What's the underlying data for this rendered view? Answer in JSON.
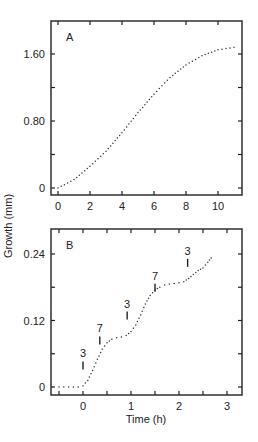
{
  "chart_data": [
    {
      "panel": "A",
      "type": "scatter",
      "title": "",
      "panel_label": "A",
      "xlabel": "",
      "ylabel": "Growth (mm)",
      "xlim": [
        -0.4,
        11.4
      ],
      "ylim": [
        -0.1,
        2.0
      ],
      "xticks": [
        0,
        2,
        4,
        6,
        8,
        10
      ],
      "xtick_labels": [
        "0",
        "2",
        "4",
        "6",
        "8",
        "10"
      ],
      "yticks": [
        0,
        0.8,
        1.6
      ],
      "ytick_labels": [
        "0",
        "0.80",
        "1.60"
      ],
      "grid": false,
      "series": [
        {
          "name": "growth",
          "style": "dotted",
          "x": [
            0,
            1,
            2,
            3,
            4,
            5,
            6,
            7,
            8,
            9,
            10,
            11
          ],
          "y": [
            0,
            0.1,
            0.26,
            0.44,
            0.66,
            0.9,
            1.12,
            1.32,
            1.47,
            1.58,
            1.65,
            1.68
          ]
        }
      ]
    },
    {
      "panel": "B",
      "type": "scatter",
      "title": "",
      "panel_label": "B",
      "xlabel": "Time (h)",
      "ylabel": "Growth (mm)",
      "xlim": [
        -0.67,
        3.31
      ],
      "ylim": [
        -0.01,
        0.28
      ],
      "xticks": [
        0,
        1,
        2,
        3
      ],
      "xtick_labels": [
        "0",
        "1",
        "2",
        "3"
      ],
      "yticks": [
        0,
        0.12,
        0.24
      ],
      "ytick_labels": [
        "0",
        "0.12",
        "0.24"
      ],
      "grid": false,
      "series": [
        {
          "name": "growth",
          "style": "dotted",
          "x": [
            -0.5,
            -0.4,
            -0.3,
            -0.2,
            -0.1,
            0.0,
            0.1,
            0.2,
            0.3,
            0.4,
            0.5,
            0.6,
            0.7,
            0.8,
            0.9,
            1.0,
            1.1,
            1.2,
            1.3,
            1.4,
            1.5,
            1.6,
            1.7,
            1.8,
            1.9,
            2.0,
            2.1,
            2.2,
            2.3,
            2.4,
            2.5,
            2.6,
            2.67
          ],
          "y": [
            0,
            0,
            0,
            0,
            0,
            0.002,
            0.012,
            0.03,
            0.05,
            0.068,
            0.08,
            0.086,
            0.089,
            0.09,
            0.093,
            0.1,
            0.112,
            0.13,
            0.15,
            0.165,
            0.175,
            0.18,
            0.184,
            0.186,
            0.187,
            0.188,
            0.19,
            0.196,
            0.203,
            0.21,
            0.215,
            0.225,
            0.233
          ]
        }
      ],
      "annotations": [
        {
          "text": "3",
          "x": 0.0,
          "y": 0.03
        },
        {
          "text": "7",
          "x": 0.35,
          "y": 0.075
        },
        {
          "text": "3",
          "x": 0.92,
          "y": 0.12
        },
        {
          "text": "7",
          "x": 1.5,
          "y": 0.17
        },
        {
          "text": "3",
          "x": 2.18,
          "y": 0.215
        }
      ]
    }
  ]
}
